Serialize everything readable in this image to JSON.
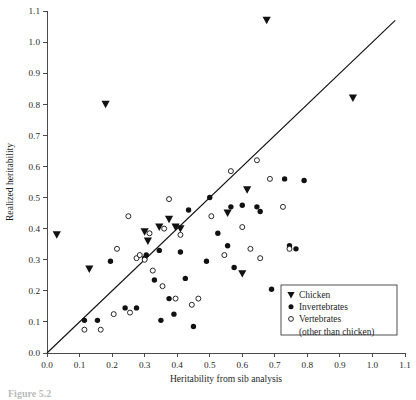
{
  "figure": {
    "caption_partial": "Figure 5.2",
    "background_color": "#ffffff",
    "marker_color": "#111111"
  },
  "chart_data": {
    "type": "scatter",
    "title": "",
    "xlabel": "Heritability from sib analysis",
    "ylabel": "Realized heritability",
    "xlim": [
      0.0,
      1.1
    ],
    "ylim": [
      0.0,
      1.1
    ],
    "xticks": [
      "0.0",
      "0.1",
      "0.2",
      "0.3",
      "0.4",
      "0.5",
      "0.6",
      "0.7",
      "0.8",
      "0.9",
      "1.0",
      "1.1"
    ],
    "yticks": [
      "0.0",
      "0.1",
      "0.2",
      "0.3",
      "0.4",
      "0.5",
      "0.6",
      "0.7",
      "0.8",
      "0.9",
      "1.0",
      "1.1"
    ],
    "grid": false,
    "legend_position": "bottom-right",
    "reference_line": {
      "label": "1:1 line",
      "x": [
        0.0,
        1.07
      ],
      "y": [
        0.0,
        1.07
      ]
    },
    "series": [
      {
        "name": "Chicken",
        "marker": "triangle-down-filled",
        "points": [
          [
            0.03,
            0.38
          ],
          [
            0.13,
            0.27
          ],
          [
            0.18,
            0.8
          ],
          [
            0.3,
            0.39
          ],
          [
            0.31,
            0.36
          ],
          [
            0.345,
            0.405
          ],
          [
            0.375,
            0.43
          ],
          [
            0.395,
            0.405
          ],
          [
            0.41,
            0.4
          ],
          [
            0.555,
            0.45
          ],
          [
            0.6,
            0.255
          ],
          [
            0.615,
            0.525
          ],
          [
            0.675,
            1.07
          ],
          [
            0.94,
            0.82
          ]
        ]
      },
      {
        "name": "Invertebrates",
        "marker": "circle-filled",
        "points": [
          [
            0.115,
            0.105
          ],
          [
            0.155,
            0.105
          ],
          [
            0.195,
            0.295
          ],
          [
            0.24,
            0.145
          ],
          [
            0.275,
            0.145
          ],
          [
            0.3,
            0.305
          ],
          [
            0.305,
            0.315
          ],
          [
            0.33,
            0.235
          ],
          [
            0.345,
            0.33
          ],
          [
            0.35,
            0.105
          ],
          [
            0.375,
            0.175
          ],
          [
            0.39,
            0.125
          ],
          [
            0.41,
            0.325
          ],
          [
            0.425,
            0.24
          ],
          [
            0.435,
            0.46
          ],
          [
            0.45,
            0.085
          ],
          [
            0.49,
            0.295
          ],
          [
            0.5,
            0.5
          ],
          [
            0.525,
            0.385
          ],
          [
            0.555,
            0.345
          ],
          [
            0.565,
            0.47
          ],
          [
            0.575,
            0.275
          ],
          [
            0.6,
            0.475
          ],
          [
            0.645,
            0.47
          ],
          [
            0.655,
            0.455
          ],
          [
            0.69,
            0.205
          ],
          [
            0.73,
            0.56
          ],
          [
            0.745,
            0.345
          ],
          [
            0.765,
            0.335
          ],
          [
            0.79,
            0.555
          ]
        ]
      },
      {
        "name": "Vertebrates (other than chicken)",
        "marker": "circle-open",
        "points": [
          [
            0.115,
            0.075
          ],
          [
            0.165,
            0.075
          ],
          [
            0.205,
            0.125
          ],
          [
            0.215,
            0.335
          ],
          [
            0.25,
            0.44
          ],
          [
            0.255,
            0.13
          ],
          [
            0.275,
            0.305
          ],
          [
            0.285,
            0.315
          ],
          [
            0.3,
            0.3
          ],
          [
            0.315,
            0.385
          ],
          [
            0.325,
            0.265
          ],
          [
            0.355,
            0.215
          ],
          [
            0.36,
            0.4
          ],
          [
            0.375,
            0.495
          ],
          [
            0.395,
            0.175
          ],
          [
            0.41,
            0.38
          ],
          [
            0.445,
            0.155
          ],
          [
            0.465,
            0.175
          ],
          [
            0.505,
            0.44
          ],
          [
            0.545,
            0.315
          ],
          [
            0.565,
            0.585
          ],
          [
            0.6,
            0.405
          ],
          [
            0.625,
            0.335
          ],
          [
            0.645,
            0.62
          ],
          [
            0.655,
            0.305
          ],
          [
            0.685,
            0.56
          ],
          [
            0.725,
            0.47
          ],
          [
            0.745,
            0.335
          ]
        ]
      }
    ]
  },
  "legend": {
    "items": [
      {
        "marker": "triangle-down-filled",
        "label": "Chicken"
      },
      {
        "marker": "circle-filled",
        "label": "Invertebrates"
      },
      {
        "marker": "circle-open",
        "label": "Vertebrates"
      }
    ],
    "continuation_label": "(other than chicken)"
  }
}
